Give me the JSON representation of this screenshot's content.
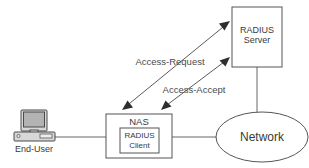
{
  "diagram": {
    "colors": {
      "background": "#ffffff",
      "shape_fill": "#ffffff",
      "shape_stroke": "#555555",
      "line": "#666666",
      "arrow": "#2e2e2e",
      "text": "#3a3a3a",
      "monitor_case": "#d8d8d8",
      "monitor_screen": "#b3b3b3"
    },
    "nodes": {
      "end_user": {
        "label": "End-User",
        "icon": "desktop-computer-icon",
        "x": 18,
        "y": 110,
        "width": 38,
        "height": 30
      },
      "nas": {
        "label": "NAS",
        "x": 106,
        "y": 114,
        "width": 66,
        "height": 44
      },
      "radius_client": {
        "label_line1": "RADIUS",
        "label_line2": "Client",
        "x": 120,
        "y": 128,
        "width": 39,
        "height": 25
      },
      "radius_server": {
        "label_line1": "RADIUS",
        "label_line2": "Server",
        "x": 232,
        "y": 7,
        "width": 50,
        "height": 60
      },
      "network": {
        "label": "Network",
        "cx": 262,
        "cy": 137,
        "rx": 46,
        "ry": 25
      }
    },
    "edges": [
      {
        "label": "Access-Request",
        "from": "nas",
        "to": "radius_server",
        "bidirectional": true,
        "label_x": 170,
        "label_y": 65
      },
      {
        "label": "Access-Accept",
        "from": "radius_server",
        "to": "nas",
        "bidirectional": true,
        "label_x": 194,
        "label_y": 93
      }
    ],
    "links": [
      {
        "name": "end-user-to-nas",
        "from": "end_user",
        "to": "nas"
      },
      {
        "name": "nas-to-network",
        "from": "nas",
        "to": "network"
      },
      {
        "name": "server-to-network",
        "from": "radius_server",
        "to": "network"
      }
    ]
  }
}
